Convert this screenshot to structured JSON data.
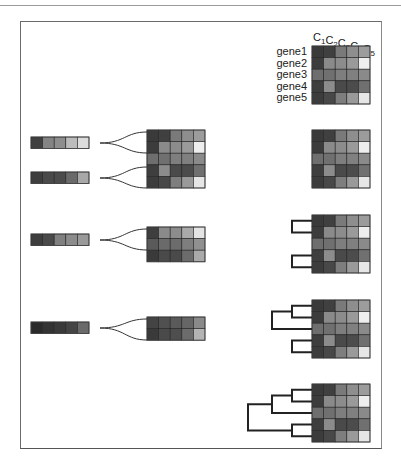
{
  "figure": {
    "type": "hierarchical-clustering-illustration",
    "column_labels": [
      {
        "base": "C",
        "sub": "1"
      },
      {
        "base": "C",
        "sub": "2"
      },
      {
        "base": "C",
        "sub": "3"
      },
      {
        "base": "C",
        "sub": "4"
      },
      {
        "base": "C",
        "sub": "5"
      }
    ],
    "row_labels": [
      "gene1",
      "gene2",
      "gene3",
      "gene4",
      "gene5"
    ],
    "expression_matrix_gray": [
      [
        "#3a3a3a",
        "#404040",
        "#7a7a7a",
        "#8e8e8e",
        "#9c9c9c"
      ],
      [
        "#3c3c3c",
        "#8a8a8a",
        "#8c8c8c",
        "#9a9a9a",
        "#eeeeee"
      ],
      [
        "#6e6e6e",
        "#707070",
        "#7e7e7e",
        "#808080",
        "#8a8a8a"
      ],
      [
        "#3e3e3e",
        "#8c8c8c",
        "#4a4a4a",
        "#4c4c4c",
        "#707070"
      ],
      [
        "#3c3c3c",
        "#484848",
        "#7e7e7e",
        "#9a9a9a",
        "#e6e6e6"
      ]
    ],
    "steps": [
      {
        "step": 1,
        "merged_profiles": [
          [
            "#404040",
            "#848484",
            "#8e8e8e",
            "#bcbcbc",
            "#dcdcdc"
          ],
          [
            "#3e3e3e",
            "#4a4a4a",
            "#4c4c4c",
            "#6a6a6a",
            "#a8a8a8"
          ]
        ],
        "remaining_rows": 5
      },
      {
        "step": 2,
        "merged_profiles": [
          [
            "#3e3e3e",
            "#4a4a4a",
            "#808080",
            "#8c8c8c",
            "#9a9a9a"
          ]
        ],
        "remaining_matrix": [
          [
            "#3e3e3e",
            "#8a8a8a",
            "#8c8c8c",
            "#aaaaaa",
            "#e4e4e4"
          ],
          [
            "#5a5a5a",
            "#6a6a6a",
            "#6c6c6c",
            "#7e7e7e",
            "#909090"
          ],
          [
            "#3a3a3a",
            "#4a4a4a",
            "#4a4a4a",
            "#6c6c6c",
            "#aaaaaa"
          ]
        ]
      },
      {
        "step": 3,
        "merged_profiles": [
          [
            "#2a2a2a",
            "#333333",
            "#3a3a3a",
            "#444444",
            "#6a6a6a"
          ]
        ],
        "remaining_matrix": [
          [
            "#444444",
            "#505050",
            "#5a5a5a",
            "#666666",
            "#8a8a8a"
          ],
          [
            "#3a3a3a",
            "#4a4a4a",
            "#4e4e4e",
            "#6c6c6c",
            "#b4b4b4"
          ]
        ]
      }
    ]
  }
}
